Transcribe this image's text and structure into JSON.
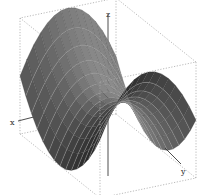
{
  "chart_data": {
    "type": "surface3d",
    "title": "",
    "function": "z = y^2 - x^2",
    "surface_kind": "saddle (hyperbolic paraboloid)",
    "axes": {
      "x": {
        "label": "x",
        "range": [
          -1,
          1
        ]
      },
      "y": {
        "label": "y",
        "range": [
          -1,
          1
        ]
      },
      "z": {
        "label": "z",
        "range": [
          -1,
          1
        ]
      }
    },
    "grid": false,
    "bounding_box": "dashed",
    "legend": "none",
    "mesh": {
      "lines": "light contour lines over dark grey surface",
      "resolution": 14
    },
    "view": {
      "azimuth_deg": -55,
      "elevation_deg": 22
    },
    "colors": {
      "surface_dark": "#2e2e2e",
      "surface_light": "#8a8a8a",
      "mesh_line": "#c8c8c8",
      "box": "#a8a8a8",
      "axis": "#3a3a3a"
    }
  },
  "labels": {
    "x": "x",
    "y": "y",
    "z": "z"
  }
}
